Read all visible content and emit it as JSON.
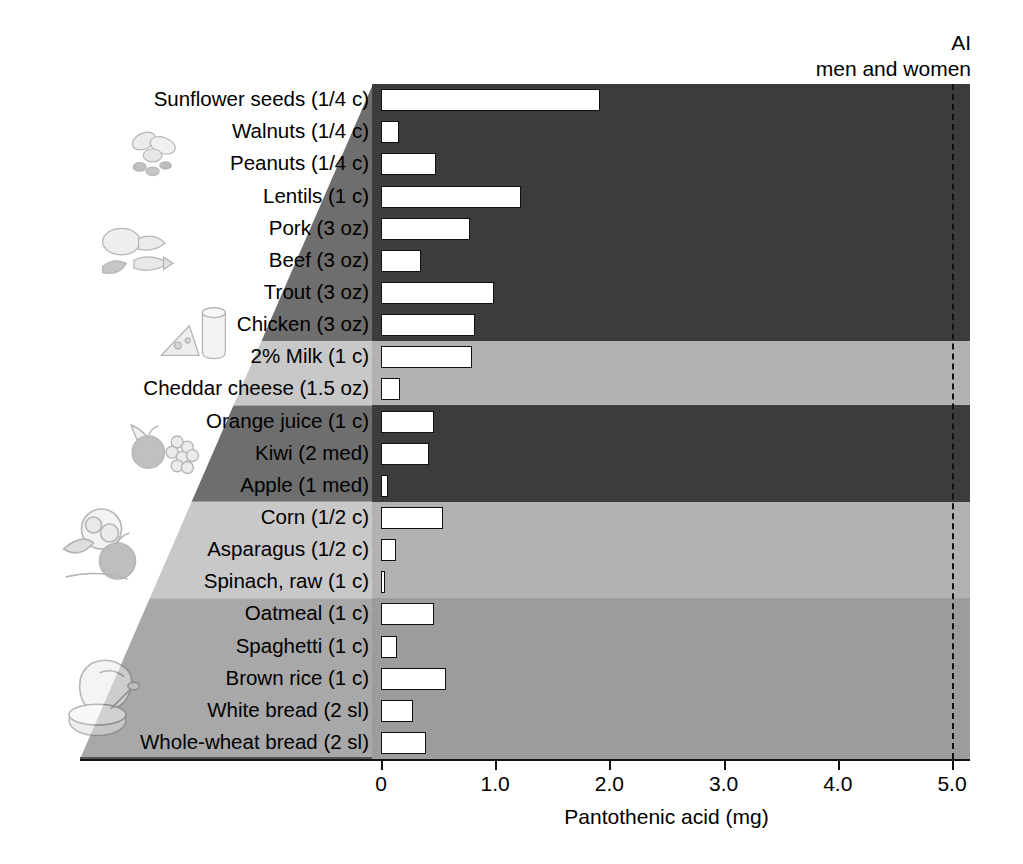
{
  "header": {
    "ai_label": "AI",
    "ai_sublabel": "men and women"
  },
  "axis": {
    "title": "Pantothenic acid (mg)",
    "ticks": [
      "0",
      "1.0",
      "2.0",
      "3.0",
      "4.0",
      "5.0"
    ]
  },
  "colors": {
    "band_dark": "#3a3a3a",
    "band_light": "#b4b4b4",
    "band_mid": "#9e9e9e",
    "bar_fill": "#ffffff",
    "bar_stroke": "#111111",
    "ai_line": "#111111"
  },
  "chart_data": {
    "type": "bar",
    "orientation": "horizontal",
    "title": "",
    "subtitle": "",
    "xlabel": "Pantothenic acid (mg)",
    "ylabel": "",
    "xlim": [
      0,
      5.25
    ],
    "xticks": [
      0,
      1.0,
      2.0,
      3.0,
      4.0,
      5.0
    ],
    "grid": false,
    "legend": "none",
    "annotations": [
      {
        "text": "AI",
        "value": 5.0,
        "type": "reference-line",
        "style": "dashed"
      },
      {
        "text": "men and women",
        "value": 5.0,
        "type": "reference-line-sublabel"
      }
    ],
    "categories": [
      "Sunflower seeds (1/4 c)",
      "Walnuts (1/4 c)",
      "Peanuts (1/4 c)",
      "Lentils (1 c)",
      "Pork (3 oz)",
      "Beef (3 oz)",
      "Trout (3 oz)",
      "Chicken (3 oz)",
      "2% Milk (1 c)",
      "Cheddar cheese (1.5 oz)",
      "Orange juice (1 c)",
      "Kiwi (2 med)",
      "Apple (1 med)",
      "Corn (1/2 c)",
      "Asparagus (1/2 c)",
      "Spinach, raw (1 c)",
      "Oatmeal (1 c)",
      "Spaghetti (1 c)",
      "Brown rice (1 c)",
      "White bread (2 sl)",
      "Whole-wheat bread (2 sl)"
    ],
    "values": [
      1.92,
      0.16,
      0.48,
      1.23,
      0.78,
      0.35,
      0.99,
      0.82,
      0.8,
      0.17,
      0.46,
      0.42,
      0.06,
      0.54,
      0.13,
      0.02,
      0.46,
      0.14,
      0.57,
      0.28,
      0.39
    ],
    "groups": [
      {
        "name": "protein-foods",
        "rows": [
          0,
          7
        ],
        "band": "dark"
      },
      {
        "name": "dairy",
        "rows": [
          8,
          9
        ],
        "band": "light"
      },
      {
        "name": "fruits",
        "rows": [
          10,
          12
        ],
        "band": "dark"
      },
      {
        "name": "vegetables",
        "rows": [
          13,
          15
        ],
        "band": "light"
      },
      {
        "name": "grains",
        "rows": [
          16,
          20
        ],
        "band": "mid"
      }
    ]
  },
  "illustrations": [
    {
      "name": "nuts-and-seeds-illustration"
    },
    {
      "name": "meat-poultry-fish-illustration"
    },
    {
      "name": "dairy-cheese-milk-illustration"
    },
    {
      "name": "fruit-basket-illustration"
    },
    {
      "name": "vegetables-illustration"
    },
    {
      "name": "grains-bread-cereal-illustration"
    }
  ]
}
